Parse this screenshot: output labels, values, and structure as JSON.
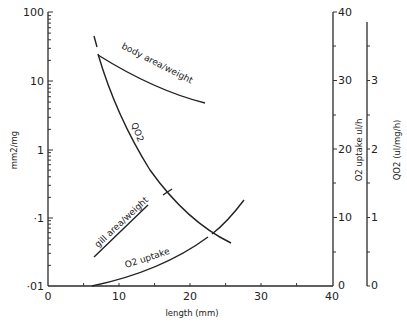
{
  "chart_data": {
    "type": "line",
    "title": "",
    "xlabel": "length (mm)",
    "xlim": [
      0,
      40
    ],
    "x_ticks": [
      "0",
      "10",
      "20",
      "30",
      "40"
    ],
    "left_axis": {
      "label": "mm2/mg",
      "scale": "log",
      "ylim": [
        0.01,
        100
      ],
      "ticks": [
        "·01",
        "·1",
        "1",
        "10",
        "100"
      ]
    },
    "right_axis_1": {
      "label": "O2 uptake ul/h",
      "ylim": [
        0,
        40
      ],
      "ticks": [
        "0",
        "10",
        "20",
        "30",
        "40"
      ]
    },
    "right_axis_2": {
      "label": "QO2 (ul/mg/h)",
      "ylim": [
        0,
        4
      ],
      "ticks": [
        "0",
        "1",
        "2",
        "3"
      ]
    },
    "grid": false,
    "series": [
      {
        "name": "body area/weight",
        "axis": "left",
        "x": [
          7,
          10,
          15,
          20,
          22
        ],
        "y": [
          22,
          12,
          7.2,
          4.5,
          3.6
        ]
      },
      {
        "name": "QO2",
        "axis": "right_2",
        "x": [
          6.5,
          8,
          12,
          15,
          18,
          22,
          26
        ],
        "y": [
          3.6,
          3.3,
          2.4,
          1.6,
          1.1,
          0.8,
          0.65
        ]
      },
      {
        "name": "gill area/weight",
        "axis": "left",
        "x": [
          6.5,
          8,
          10,
          12,
          14,
          16.5
        ],
        "y": [
          0.03,
          0.037,
          0.05,
          0.068,
          0.09,
          0.12
        ]
      },
      {
        "name": "O2 uptake",
        "axis": "right_1",
        "x": [
          6,
          10,
          15,
          20,
          24,
          28
        ],
        "y": [
          0,
          0.8,
          2.5,
          5.5,
          8.5,
          13.5
        ]
      }
    ],
    "annotations": [
      "body area/weight",
      "QO2",
      "gill area/weight",
      "O2 uptake"
    ]
  },
  "labels": {
    "xlabel": "length (mm)",
    "left_ylabel": "mm2/mg",
    "right1_ylabel": "O2 uptake ul/h",
    "right2_ylabel": "QO2 (ul/mg/h)",
    "body": "body area/weight",
    "qo2": "QO2",
    "gill": "gill area/weight",
    "uptake": "O2 uptake",
    "x0": "0",
    "x10": "10",
    "x20": "20",
    "x30": "30",
    "x40": "40",
    "l100": "100",
    "l10": "10",
    "l1": "1",
    "l01": "·1",
    "l001": "·01",
    "r0": "0",
    "r10": "10",
    "r20": "20",
    "r30": "30",
    "r40": "40",
    "q0": "0",
    "q1": "1",
    "q2": "2",
    "q3": "3"
  }
}
